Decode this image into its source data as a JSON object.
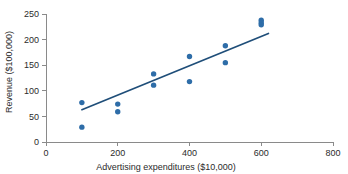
{
  "chart_data": {
    "type": "scatter",
    "title": "",
    "xlabel": "Advertising expenditures ($10,000)",
    "ylabel": "Revenue ($100,000)",
    "xlim": [
      0,
      800
    ],
    "ylim": [
      0,
      250
    ],
    "xticks": [
      0,
      200,
      400,
      600,
      800
    ],
    "yticks": [
      0,
      50,
      100,
      150,
      200,
      250
    ],
    "xtick_labels": [
      "0",
      "200",
      "400",
      "600",
      "800"
    ],
    "ytick_labels": [
      "0",
      "50",
      "100",
      "150",
      "200",
      "250"
    ],
    "grid": false,
    "legend": null,
    "point_color": "#2E6DA8",
    "line_color": "#1F4E79",
    "axis_color": "#8A8A8A",
    "points": [
      {
        "x": 100,
        "y": 77
      },
      {
        "x": 100,
        "y": 29
      },
      {
        "x": 200,
        "y": 74
      },
      {
        "x": 200,
        "y": 59
      },
      {
        "x": 300,
        "y": 133
      },
      {
        "x": 300,
        "y": 111
      },
      {
        "x": 400,
        "y": 167
      },
      {
        "x": 400,
        "y": 118
      },
      {
        "x": 500,
        "y": 188
      },
      {
        "x": 500,
        "y": 155
      },
      {
        "x": 600,
        "y": 238
      },
      {
        "x": 600,
        "y": 233
      },
      {
        "x": 600,
        "y": 229
      }
    ],
    "series": [
      {
        "name": "Revenue vs advertising expenditures",
        "x": [
          100,
          100,
          200,
          200,
          300,
          300,
          400,
          400,
          500,
          500,
          600,
          600,
          600
        ],
        "values": [
          77,
          29,
          74,
          59,
          133,
          111,
          167,
          118,
          188,
          155,
          238,
          233,
          229
        ]
      }
    ],
    "trend_line": {
      "name": "regression-line",
      "x_start": 100,
      "y_start": 63,
      "x_end": 620,
      "y_end": 212
    }
  }
}
